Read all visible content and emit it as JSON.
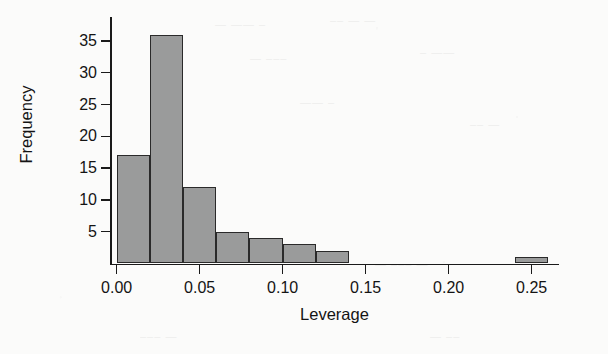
{
  "chart_data": {
    "type": "bar",
    "subtype": "histogram",
    "title": "",
    "xlabel": "Leverage",
    "ylabel": "Frequency",
    "xlim": [
      -0.004,
      0.2665
    ],
    "ylim": [
      0,
      37.5
    ],
    "bin_width": 0.02,
    "grid": false,
    "legend": null,
    "bar_fill_color": "#9a9b9b",
    "bar_edge_color": "#2a2a2a",
    "background_color": "#fbfbfa",
    "axis_color": "#1a1a1a",
    "x_ticks": [
      0.0,
      0.05,
      0.1,
      0.15,
      0.2,
      0.25
    ],
    "x_tick_labels": [
      "0.00",
      "0.05",
      "0.10",
      "0.15",
      "0.20",
      "0.25"
    ],
    "y_ticks": [
      5,
      10,
      15,
      20,
      25,
      30,
      35
    ],
    "y_tick_labels": [
      "5",
      "10",
      "15",
      "20",
      "25",
      "30",
      "35"
    ],
    "bins": [
      {
        "x0": 0.0,
        "x1": 0.02,
        "value": 17
      },
      {
        "x0": 0.02,
        "x1": 0.04,
        "value": 36
      },
      {
        "x0": 0.04,
        "x1": 0.06,
        "value": 12
      },
      {
        "x0": 0.06,
        "x1": 0.08,
        "value": 5
      },
      {
        "x0": 0.08,
        "x1": 0.1,
        "value": 4
      },
      {
        "x0": 0.1,
        "x1": 0.12,
        "value": 3
      },
      {
        "x0": 0.12,
        "x1": 0.14,
        "value": 2
      },
      {
        "x0": 0.14,
        "x1": 0.16,
        "value": 0
      },
      {
        "x0": 0.16,
        "x1": 0.18,
        "value": 0
      },
      {
        "x0": 0.18,
        "x1": 0.2,
        "value": 0
      },
      {
        "x0": 0.2,
        "x1": 0.22,
        "value": 0
      },
      {
        "x0": 0.22,
        "x1": 0.24,
        "value": 0
      },
      {
        "x0": 0.24,
        "x1": 0.26,
        "value": 1
      }
    ],
    "categories": [
      "0.00-0.02",
      "0.02-0.04",
      "0.04-0.06",
      "0.06-0.08",
      "0.08-0.10",
      "0.10-0.12",
      "0.12-0.14",
      "0.14-0.16",
      "0.16-0.18",
      "0.18-0.20",
      "0.20-0.22",
      "0.22-0.24",
      "0.24-0.26"
    ],
    "values": [
      17,
      36,
      12,
      5,
      4,
      3,
      2,
      0,
      0,
      0,
      0,
      0,
      1
    ]
  },
  "ghost_marks": [
    {
      "text": "— —— –",
      "left": 215,
      "top": 18
    },
    {
      "text": "–– — —",
      "left": 330,
      "top": 14
    },
    {
      "text": "—  –––",
      "left": 250,
      "top": 52
    },
    {
      "text": "– ——",
      "left": 420,
      "top": 46
    },
    {
      "text": "——  –",
      "left": 300,
      "top": 96
    },
    {
      "text": "–– —",
      "left": 470,
      "top": 118
    },
    {
      "text": "— ––– —",
      "left": 375,
      "top": 258
    },
    {
      "text": "–––  —",
      "left": 140,
      "top": 330
    },
    {
      "text": "— ––",
      "left": 430,
      "top": 330
    }
  ]
}
